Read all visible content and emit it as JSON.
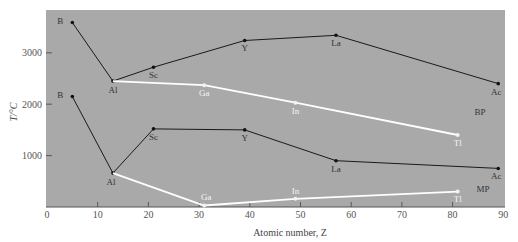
{
  "chart_data": {
    "type": "line",
    "title": "",
    "xlabel": "Atomic number,  Z",
    "ylabel": "T/°C",
    "xlim": [
      0,
      90
    ],
    "ylim": [
      0,
      3850
    ],
    "xticks": [
      0,
      10,
      20,
      30,
      40,
      50,
      60,
      70,
      80,
      90
    ],
    "yticks": [
      1000,
      2000,
      3000
    ],
    "grid": false,
    "background": "#a9a9a9",
    "annotations": [
      "BP",
      "MP"
    ],
    "series": [
      {
        "name": "BP (B, Al, Sc, Y, La, Ac)",
        "group": "BP",
        "color": "#1a1a1a",
        "points": [
          {
            "label": "B",
            "z": 5,
            "t": 3590
          },
          {
            "label": "Al",
            "z": 13,
            "t": 2450
          },
          {
            "label": "Sc",
            "z": 21,
            "t": 2720
          },
          {
            "label": "Y",
            "z": 39,
            "t": 3240
          },
          {
            "label": "La",
            "z": 57,
            "t": 3340
          },
          {
            "label": "Ac",
            "z": 89,
            "t": 2400
          }
        ]
      },
      {
        "name": "BP (Al, Ga, In, Tl)",
        "group": "BP",
        "color": "#ffffff",
        "points": [
          {
            "label": "Al",
            "z": 13,
            "t": 2450
          },
          {
            "label": "Ga",
            "z": 31,
            "t": 2370
          },
          {
            "label": "In",
            "z": 49,
            "t": 2030
          },
          {
            "label": "Tl",
            "z": 81,
            "t": 1400
          }
        ]
      },
      {
        "name": "MP (B, Al, Sc, Y, La, Ac)",
        "group": "MP",
        "color": "#1a1a1a",
        "points": [
          {
            "label": "B",
            "z": 5,
            "t": 2150
          },
          {
            "label": "Al",
            "z": 13,
            "t": 660
          },
          {
            "label": "Sc",
            "z": 21,
            "t": 1520
          },
          {
            "label": "Y",
            "z": 39,
            "t": 1500
          },
          {
            "label": "La",
            "z": 57,
            "t": 900
          },
          {
            "label": "Ac",
            "z": 89,
            "t": 750
          }
        ]
      },
      {
        "name": "MP (Al, Ga, In, Tl)",
        "group": "MP",
        "color": "#ffffff",
        "points": [
          {
            "label": "Al",
            "z": 13,
            "t": 660
          },
          {
            "label": "Ga",
            "z": 31,
            "t": 30
          },
          {
            "label": "In",
            "z": 49,
            "t": 160
          },
          {
            "label": "Tl",
            "z": 81,
            "t": 300
          }
        ]
      }
    ]
  },
  "labels": {
    "ylabel": "T/°C",
    "xlabel": "Atomic number,  Z",
    "bp_tag": "BP",
    "mp_tag": "MP"
  }
}
